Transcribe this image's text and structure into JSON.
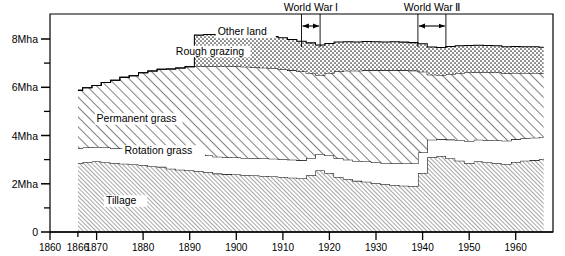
{
  "chart_data": {
    "type": "area",
    "title": "",
    "subtitle": "",
    "xlabel": "",
    "ylabel": "",
    "stacked": true,
    "grid": false,
    "legend_position": "inline-labels",
    "xlim": [
      1860,
      1968
    ],
    "ylim": [
      0,
      8.6
    ],
    "y_unit": "Mha",
    "x_ticks": [
      1860,
      1866,
      1870,
      1880,
      1890,
      1900,
      1910,
      1920,
      1930,
      1940,
      1950,
      1960
    ],
    "x_tick_labels": [
      "1860",
      "1866",
      "1870",
      "1880",
      "1890",
      "1900",
      "1910",
      "1920",
      "1930",
      "1940",
      "1950",
      "1960"
    ],
    "y_ticks": [
      0,
      1,
      2,
      3,
      4,
      5,
      6,
      7,
      8
    ],
    "y_tick_labels": [
      "0",
      "",
      "2Mha",
      "",
      "4Mha",
      "",
      "6Mha",
      "",
      "8Mha"
    ],
    "y_major_ticks": [
      0,
      2,
      4,
      6,
      8
    ],
    "data_start_year": 1866,
    "data_end_year": 1966,
    "x": [
      1866,
      1868,
      1870,
      1872,
      1874,
      1876,
      1878,
      1880,
      1882,
      1884,
      1886,
      1888,
      1890,
      1892,
      1894,
      1896,
      1898,
      1900,
      1902,
      1904,
      1906,
      1908,
      1910,
      1912,
      1914,
      1916,
      1918,
      1920,
      1922,
      1924,
      1926,
      1928,
      1930,
      1932,
      1934,
      1936,
      1938,
      1940,
      1942,
      1944,
      1946,
      1948,
      1950,
      1952,
      1954,
      1956,
      1958,
      1960,
      1962,
      1964,
      1966
    ],
    "series": [
      {
        "name": "Tillage",
        "label": "Tillage",
        "fill": "fine-hatch",
        "label_x_year": 1872,
        "label_y_value": 1.15,
        "values": [
          2.85,
          2.9,
          2.92,
          2.88,
          2.85,
          2.83,
          2.8,
          2.78,
          2.72,
          2.7,
          2.62,
          2.58,
          2.55,
          2.52,
          2.48,
          2.42,
          2.4,
          2.38,
          2.35,
          2.34,
          2.32,
          2.3,
          2.28,
          2.25,
          2.22,
          2.35,
          2.55,
          2.45,
          2.28,
          2.2,
          2.12,
          2.08,
          2.02,
          1.98,
          1.95,
          1.92,
          1.9,
          2.45,
          3.1,
          3.15,
          3.05,
          2.95,
          2.85,
          2.92,
          2.88,
          2.85,
          2.82,
          2.9,
          2.95,
          2.98,
          3.02
        ]
      },
      {
        "name": "Rotation grass",
        "label": "Rotation grass",
        "fill": "white",
        "label_x_year": 1876,
        "label_y_value": 3.22,
        "values": [
          0.62,
          0.6,
          0.6,
          0.62,
          0.62,
          0.63,
          0.63,
          0.64,
          0.65,
          0.65,
          0.66,
          0.67,
          0.68,
          0.68,
          0.69,
          0.7,
          0.7,
          0.71,
          0.72,
          0.72,
          0.73,
          0.74,
          0.74,
          0.75,
          0.75,
          0.72,
          0.68,
          0.72,
          0.78,
          0.8,
          0.82,
          0.84,
          0.86,
          0.88,
          0.9,
          0.92,
          0.94,
          0.85,
          0.72,
          0.7,
          0.78,
          0.86,
          0.92,
          0.9,
          0.92,
          0.94,
          0.96,
          0.95,
          0.94,
          0.93,
          0.92
        ]
      },
      {
        "name": "Permanent grass",
        "label": "Permanent grass",
        "fill": "coarse-hatch",
        "label_x_year": 1870,
        "label_y_value": 4.55,
        "values": [
          2.4,
          2.48,
          2.55,
          2.7,
          2.82,
          2.95,
          3.05,
          3.18,
          3.3,
          3.4,
          3.48,
          3.55,
          3.62,
          3.66,
          3.7,
          3.74,
          3.76,
          3.78,
          3.78,
          3.77,
          3.76,
          3.75,
          3.73,
          3.7,
          3.68,
          3.52,
          3.28,
          3.42,
          3.6,
          3.68,
          3.74,
          3.78,
          3.82,
          3.84,
          3.86,
          3.86,
          3.85,
          3.34,
          2.7,
          2.66,
          2.72,
          2.78,
          2.84,
          2.8,
          2.82,
          2.82,
          2.8,
          2.74,
          2.7,
          2.68,
          2.64
        ]
      },
      {
        "name": "Rough grazing",
        "label": "Rough grazing",
        "fill": "stipple",
        "label_x_year": 1887,
        "label_y_value": 7.35,
        "values": [
          0.0,
          0.0,
          0.0,
          0.0,
          0.0,
          0.0,
          0.0,
          0.0,
          0.0,
          0.0,
          0.0,
          0.0,
          0.0,
          1.3,
          1.32,
          1.33,
          1.34,
          1.35,
          1.34,
          1.33,
          1.32,
          1.31,
          1.3,
          1.28,
          1.26,
          1.25,
          1.24,
          1.22,
          1.22,
          1.21,
          1.2,
          1.2,
          1.19,
          1.18,
          1.18,
          1.17,
          1.16,
          1.16,
          1.15,
          1.14,
          1.14,
          1.13,
          1.12,
          1.12,
          1.11,
          1.11,
          1.1,
          1.1,
          1.09,
          1.09,
          1.08
        ]
      },
      {
        "name": "Other land",
        "label": "Other land",
        "fill": "white",
        "label_x_year": 1896,
        "label_y_value": 8.15,
        "values": [
          0.0,
          0.0,
          0.0,
          0.0,
          0.0,
          0.0,
          0.0,
          0.0,
          0.0,
          0.0,
          0.0,
          0.0,
          0.0,
          0.0,
          0.0,
          0.0,
          0.0,
          0.0,
          0.0,
          0.0,
          0.0,
          0.0,
          0.0,
          0.0,
          0.0,
          0.0,
          0.0,
          0.0,
          0.0,
          0.0,
          0.0,
          0.0,
          0.0,
          0.0,
          0.0,
          0.0,
          0.0,
          0.0,
          0.0,
          0.0,
          0.0,
          0.0,
          0.0,
          0.0,
          0.0,
          0.0,
          0.0,
          0.0,
          0.0,
          0.0,
          0.0
        ]
      }
    ],
    "annotations": [
      {
        "name": "world-war-1",
        "label": "World War I",
        "start_year": 1914,
        "end_year": 1918,
        "label_year": 1916
      },
      {
        "name": "world-war-2",
        "label": "World War Ⅱ",
        "start_year": 1939,
        "end_year": 1945,
        "label_year": 1942
      }
    ]
  }
}
